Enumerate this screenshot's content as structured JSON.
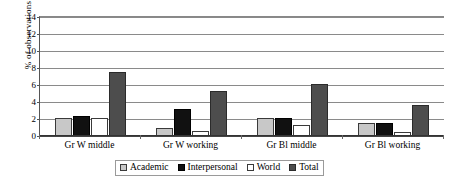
{
  "chart_data": {
    "type": "bar",
    "title": "",
    "xlabel": "",
    "ylabel": "% of observations",
    "ylim": [
      0,
      14
    ],
    "yticks": [
      0,
      2,
      4,
      6,
      8,
      10,
      12,
      14
    ],
    "grid": true,
    "legend_position": "bottom",
    "categories": [
      "Gr W middle",
      "Gr W working",
      "Gr Bl middle",
      "Gr Bl working"
    ],
    "series": [
      {
        "name": "Academic",
        "color": "#c8c8c8",
        "values": [
          2.1,
          0.9,
          2.1,
          1.5
        ]
      },
      {
        "name": "Interpersonal",
        "color": "#111111",
        "values": [
          2.4,
          3.2,
          2.1,
          1.5
        ]
      },
      {
        "name": "World",
        "color": "#ffffff",
        "values": [
          2.1,
          0.6,
          1.3,
          0.5
        ]
      },
      {
        "name": "Total",
        "color": "#4d4d4d",
        "values": [
          7.5,
          5.3,
          6.1,
          3.7
        ]
      }
    ]
  }
}
